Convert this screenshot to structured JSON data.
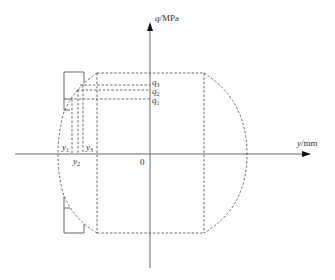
{
  "diagram": {
    "axes": {
      "y_axis_label_var": "q",
      "y_axis_label_unit": "/MPa",
      "x_axis_label_var": "y",
      "x_axis_label_unit": "/mm",
      "origin_label": "0"
    },
    "q_labels": [
      {
        "var": "q",
        "sub": "3"
      },
      {
        "var": "q",
        "sub": "2"
      },
      {
        "var": "q",
        "sub": "1"
      }
    ],
    "y_labels": [
      {
        "var": "y",
        "sub": "1"
      },
      {
        "var": "y",
        "sub": "2"
      },
      {
        "var": "y",
        "sub": "3"
      }
    ],
    "colors": {
      "axis": "#555555",
      "dashed": "#444444",
      "solid_plate": "#555555"
    }
  }
}
